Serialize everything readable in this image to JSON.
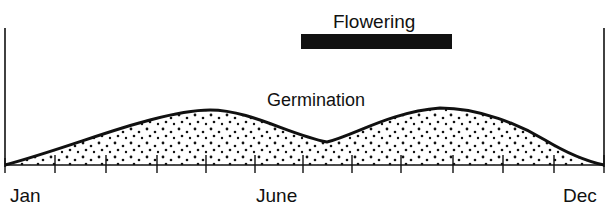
{
  "labels": {
    "flowering": "Flowering",
    "germination": "Germination"
  },
  "axis": {
    "months": [
      "Jan",
      "June",
      "Dec"
    ],
    "tick_count": 13
  },
  "colors": {
    "ink": "#111111",
    "background": "#ffffff"
  },
  "series": {
    "germination": {
      "type": "bimodal-curve",
      "fill": "stippled",
      "peaks": [
        "~May",
        "~Sept"
      ],
      "trough": "~July"
    },
    "flowering": {
      "type": "bar",
      "span": "June to Sept"
    }
  }
}
